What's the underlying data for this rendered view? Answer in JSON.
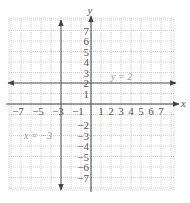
{
  "chart_data": {
    "type": "line",
    "title": "",
    "xlabel": "x",
    "ylabel": "y",
    "xlim": [
      -8,
      8
    ],
    "ylim": [
      -8,
      8
    ],
    "grid": true,
    "x_tick_labels": [
      "-7",
      "-5",
      "-3",
      "-1",
      "1",
      "2",
      "3",
      "4",
      "5",
      "6",
      "7"
    ],
    "y_tick_labels": [
      "7",
      "6",
      "5",
      "4",
      "3",
      "2",
      "1",
      "-2",
      "-3",
      "-4",
      "-5",
      "-6",
      "-7"
    ],
    "series": [
      {
        "name": "y = 2",
        "kind": "horizontal_line",
        "y": 2,
        "x": [
          -8,
          8
        ]
      },
      {
        "name": "x = -3",
        "kind": "vertical_line",
        "x": -3,
        "y": [
          -8,
          8
        ]
      }
    ],
    "annotations": [
      {
        "text": "y = 2",
        "x": 3.2,
        "y": 2.4
      },
      {
        "text": "x = −3",
        "x": -6.5,
        "y": -3
      }
    ]
  },
  "axes": {
    "x_label": "x",
    "y_label": "y"
  },
  "labels": {
    "x_ticks": [
      {
        "text": "−7",
        "x": -7
      },
      {
        "text": "−5",
        "x": -5
      },
      {
        "text": "−3",
        "x": -3
      },
      {
        "text": "−1",
        "x": -1
      },
      {
        "text": "1",
        "x": 1
      },
      {
        "text": "2",
        "x": 2
      },
      {
        "text": "3",
        "x": 3
      },
      {
        "text": "4",
        "x": 4
      },
      {
        "text": "5",
        "x": 5
      },
      {
        "text": "6",
        "x": 6
      },
      {
        "text": "7",
        "x": 7
      }
    ],
    "y_ticks": [
      {
        "text": "7",
        "y": 7
      },
      {
        "text": "6",
        "y": 6
      },
      {
        "text": "5",
        "y": 5
      },
      {
        "text": "4",
        "y": 4
      },
      {
        "text": "3",
        "y": 3
      },
      {
        "text": "2",
        "y": 2
      },
      {
        "text": "1",
        "y": 1
      },
      {
        "text": "−2",
        "y": -2
      },
      {
        "text": "−3",
        "y": -3
      },
      {
        "text": "−4",
        "y": -4
      },
      {
        "text": "−5",
        "y": -5
      },
      {
        "text": "−6",
        "y": -6
      },
      {
        "text": "−7",
        "y": -7
      }
    ]
  },
  "equations": {
    "horizontal": "y = 2",
    "vertical": "x = −3"
  }
}
